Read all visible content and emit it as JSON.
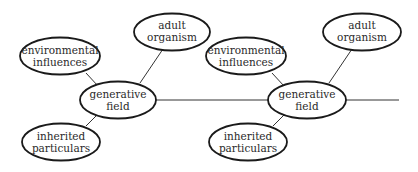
{
  "diagram": {
    "type": "concept-map",
    "groups": [
      {
        "id": "left",
        "nodes": {
          "environmental": {
            "line1": "environmental",
            "line2": "influences"
          },
          "adult": {
            "line1": "adult",
            "line2": "organism"
          },
          "generative": {
            "line1": "generative",
            "line2": "field"
          },
          "inherited": {
            "line1": "inherited",
            "line2": "particulars"
          }
        }
      },
      {
        "id": "right",
        "nodes": {
          "environmental": {
            "line1": "environmental",
            "line2": "influences"
          },
          "adult": {
            "line1": "adult",
            "line2": "organism"
          },
          "generative": {
            "line1": "generative",
            "line2": "field"
          },
          "inherited": {
            "line1": "inherited",
            "line2": "particulars"
          }
        }
      }
    ],
    "edges": [
      "environmental influences — generative field",
      "adult organism — generative field",
      "inherited particulars — generative field",
      "generative field — next generative field"
    ],
    "colors": {
      "stroke": "#1a1a1a",
      "text": "#2a2a2a",
      "background": "#ffffff"
    }
  }
}
